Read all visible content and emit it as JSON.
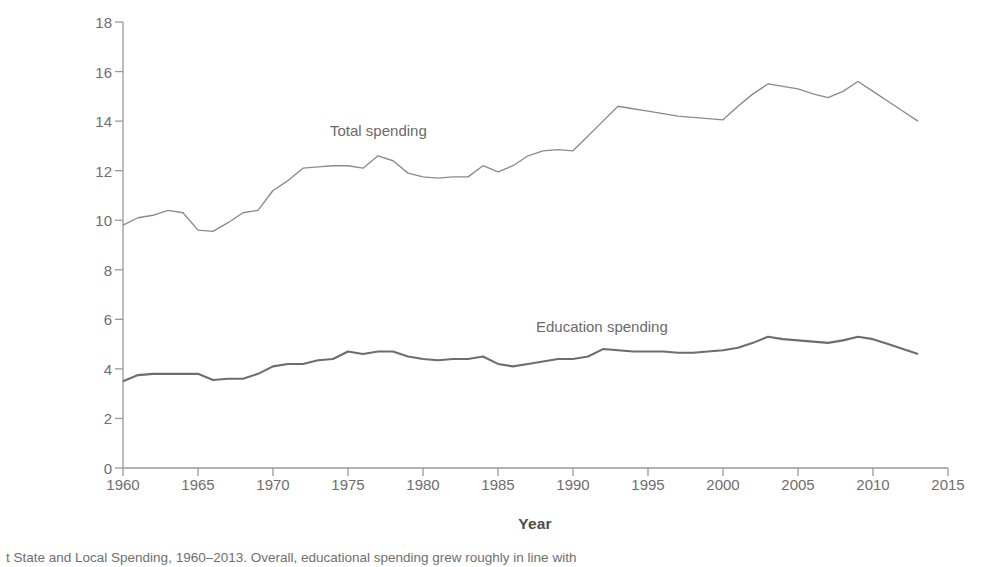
{
  "figure": {
    "xlabel": "Year",
    "ylabel_line1": "State and Local Spending",
    "ylabel_line2": "(as percentage of GDP)",
    "ylabel": "State and Local Spending\n(as percentage of GDP)",
    "caption": "t State and Local Spending, 1960–2013. Overall, educational spending grew roughly in line with",
    "label_total": "Total spending",
    "label_education": "Education spending",
    "colors": {
      "total_line": "#8a8a8a",
      "education_line": "#6d6d6d",
      "axis": "#9a9a9a",
      "tick_text": "#6e6e6e",
      "axis_title": "#4d4d4d"
    }
  },
  "chart_data": {
    "type": "line",
    "title": "",
    "xlabel": "Year",
    "ylabel": "State and Local Spending (as percentage of GDP)",
    "xlim": [
      1960,
      2015
    ],
    "ylim": [
      0,
      18
    ],
    "xticks": [
      1960,
      1965,
      1970,
      1975,
      1980,
      1985,
      1990,
      1995,
      2000,
      2005,
      2010,
      2015
    ],
    "yticks": [
      0,
      2,
      4,
      6,
      8,
      10,
      12,
      14,
      16,
      18
    ],
    "grid": false,
    "legend": "inline-annotations",
    "x": [
      1960,
      1961,
      1962,
      1963,
      1964,
      1965,
      1966,
      1967,
      1968,
      1969,
      1970,
      1971,
      1972,
      1973,
      1974,
      1975,
      1976,
      1977,
      1978,
      1979,
      1980,
      1981,
      1982,
      1983,
      1984,
      1985,
      1986,
      1987,
      1988,
      1989,
      1990,
      1991,
      1992,
      1993,
      1994,
      1995,
      1996,
      1997,
      1998,
      1999,
      2000,
      2001,
      2002,
      2003,
      2004,
      2005,
      2006,
      2007,
      2008,
      2009,
      2010,
      2011,
      2012,
      2013
    ],
    "series": [
      {
        "name": "Total spending",
        "color": "#8a8a8a",
        "values": [
          9.8,
          10.1,
          10.2,
          10.4,
          10.3,
          9.6,
          9.55,
          9.9,
          10.3,
          10.4,
          11.2,
          11.6,
          12.1,
          12.15,
          12.2,
          12.2,
          12.1,
          12.6,
          12.4,
          11.9,
          11.75,
          11.7,
          11.75,
          11.75,
          12.2,
          11.95,
          12.2,
          12.6,
          12.8,
          12.85,
          12.8,
          13.4,
          14.0,
          14.6,
          14.5,
          14.4,
          14.3,
          14.2,
          14.15,
          14.1,
          14.05,
          14.6,
          15.1,
          15.5,
          15.4,
          15.3,
          15.1,
          14.95,
          15.2,
          15.6,
          15.2,
          14.8,
          14.4,
          14.0
        ]
      },
      {
        "name": "Education spending",
        "color": "#6d6d6d",
        "values": [
          3.5,
          3.75,
          3.8,
          3.8,
          3.8,
          3.8,
          3.55,
          3.6,
          3.6,
          3.8,
          4.1,
          4.2,
          4.2,
          4.35,
          4.4,
          4.7,
          4.6,
          4.7,
          4.7,
          4.5,
          4.4,
          4.35,
          4.4,
          4.4,
          4.5,
          4.2,
          4.1,
          4.2,
          4.3,
          4.4,
          4.4,
          4.5,
          4.8,
          4.75,
          4.7,
          4.7,
          4.7,
          4.65,
          4.65,
          4.7,
          4.75,
          4.85,
          5.05,
          5.3,
          5.2,
          5.15,
          5.1,
          5.05,
          5.15,
          5.3,
          5.2,
          5.0,
          4.8,
          4.6
        ]
      }
    ]
  }
}
